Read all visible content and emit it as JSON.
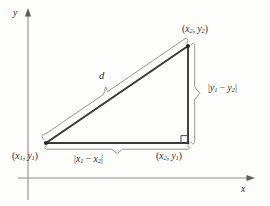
{
  "figure": {
    "kind": "distance-formula-diagram",
    "axes": {
      "x_label": "x",
      "y_label": "y",
      "x_axis_y": 178,
      "y_axis_x": 28
    },
    "colors": {
      "ink": "#2b2b2b",
      "axis": "#8a8a8a",
      "triangle_stroke": "#3a3a3a",
      "brace": "#9a9a9a",
      "background": "#fdfdfc"
    },
    "triangle": {
      "vertices": [
        {
          "name": "lower-left",
          "x": 46,
          "y": 143
        },
        {
          "name": "upper-right",
          "x": 188,
          "y": 46
        },
        {
          "name": "lower-right",
          "x": 188,
          "y": 143
        }
      ],
      "right_angle_at": "lower-right"
    },
    "labels": {
      "point_upper_right": {
        "open": "(",
        "x_var": "x",
        "x_sub": "2",
        "comma": ", ",
        "y_var": "y",
        "y_sub": "2",
        "close": ")"
      },
      "point_lower_left": {
        "open": "(",
        "x_var": "x",
        "x_sub": "1",
        "comma": ", ",
        "y_var": "y",
        "y_sub": "1",
        "close": ")"
      },
      "point_lower_right": {
        "open": "(",
        "x_var": "x",
        "x_sub": "2",
        "comma": ", ",
        "y_var": "y",
        "y_sub": "1",
        "close": ")"
      },
      "horizontal_length": {
        "open": "|",
        "a_var": "x",
        "a_sub": "1",
        "op": " − ",
        "b_var": "x",
        "b_sub": "2",
        "close": "|"
      },
      "vertical_length": {
        "open": "|",
        "a_var": "y",
        "a_sub": "1",
        "op": " − ",
        "b_var": "y",
        "b_sub": "2",
        "close": "|"
      },
      "hypotenuse": "d"
    }
  }
}
